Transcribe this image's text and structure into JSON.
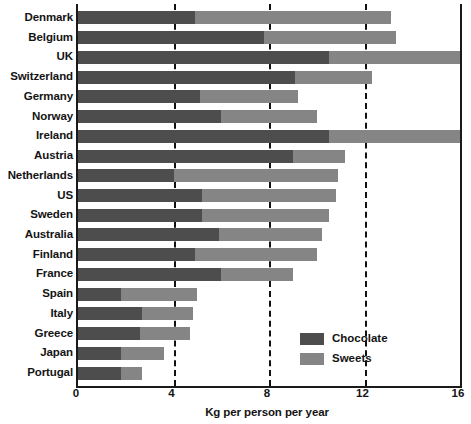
{
  "chart_data": {
    "type": "bar",
    "orientation": "horizontal",
    "stacked": true,
    "title": "",
    "xlabel": "Kg per person per year",
    "ylabel": "",
    "xlim": [
      0,
      16
    ],
    "xticks": [
      0,
      4,
      8,
      12,
      16
    ],
    "xtick_labels": [
      "0",
      "4",
      "8",
      "12",
      "16"
    ],
    "grid": "vertical-dashed",
    "legend_position": "inside-bottom-right",
    "categories": [
      "Denmark",
      "Belgium",
      "UK",
      "Switzerland",
      "Germany",
      "Norway",
      "Ireland",
      "Austria",
      "Netherlands",
      "US",
      "Sweden",
      "Australia",
      "Finland",
      "France",
      "Spain",
      "Italy",
      "Greece",
      "Japan",
      "Portugal"
    ],
    "series": [
      {
        "name": "Chocolate",
        "color": "#4d4d4d",
        "values": [
          4.9,
          7.8,
          10.5,
          9.1,
          5.1,
          6.0,
          10.5,
          9.0,
          4.0,
          5.2,
          5.2,
          5.9,
          4.9,
          6.0,
          1.8,
          2.7,
          2.6,
          1.8,
          1.8
        ]
      },
      {
        "name": "Sweets",
        "color": "#858585",
        "values": [
          8.2,
          5.5,
          5.5,
          3.2,
          4.1,
          4.0,
          5.5,
          2.2,
          6.9,
          5.6,
          5.3,
          4.3,
          5.1,
          3.0,
          3.2,
          2.1,
          2.1,
          1.8,
          0.9
        ]
      }
    ],
    "totals": [
      13.1,
      13.3,
      16.0,
      12.3,
      9.2,
      10.0,
      16.0,
      11.2,
      10.9,
      10.8,
      10.5,
      10.2,
      10.0,
      9.0,
      5.0,
      4.8,
      4.7,
      3.6,
      2.7
    ]
  },
  "legend": {
    "items": [
      {
        "label": "Chocolate",
        "color": "#4d4d4d"
      },
      {
        "label": "Sweets",
        "color": "#858585"
      }
    ]
  },
  "axis": {
    "x_title": "Kg per person per year"
  }
}
